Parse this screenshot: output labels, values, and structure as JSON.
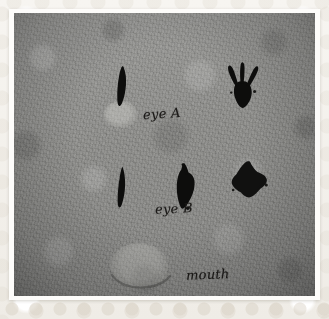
{
  "scene": {
    "kind": "photograph",
    "medium_description": "ink blots on mottled gray paper",
    "frame_style": "cream lace photo border"
  },
  "labels": [
    {
      "id": "eye-a",
      "text": "eye A"
    },
    {
      "id": "eye-b",
      "text": "eye B"
    },
    {
      "id": "mouth",
      "text": "mouth"
    }
  ],
  "blots": [
    {
      "id": "blot-top-left",
      "shape": "narrow-vertical-teardrop",
      "row": "top",
      "color": "#0d0d0c"
    },
    {
      "id": "blot-top-right",
      "shape": "three-pronged-splatter",
      "row": "top",
      "color": "#0d0d0c"
    },
    {
      "id": "blot-bottom-left",
      "shape": "narrow-vertical-slit",
      "row": "bottom",
      "color": "#0d0d0c"
    },
    {
      "id": "blot-bottom-mid",
      "shape": "elongated-vertical-blob",
      "row": "bottom",
      "color": "#0d0d0c"
    },
    {
      "id": "blot-bottom-right",
      "shape": "rounded-diamond",
      "row": "bottom",
      "color": "#111110"
    }
  ],
  "stains": [
    {
      "id": "stain-eye-a",
      "shape": "faint-light-circle"
    },
    {
      "id": "stain-mouth",
      "shape": "faint-light-circle-with-curved-line"
    }
  ],
  "colors": {
    "paper": "#8f8f8c",
    "ink": "#0d0d0c",
    "frame": "#f7f5f1",
    "mat": "#fdfcfa",
    "label_ink": "#1c1a18"
  }
}
